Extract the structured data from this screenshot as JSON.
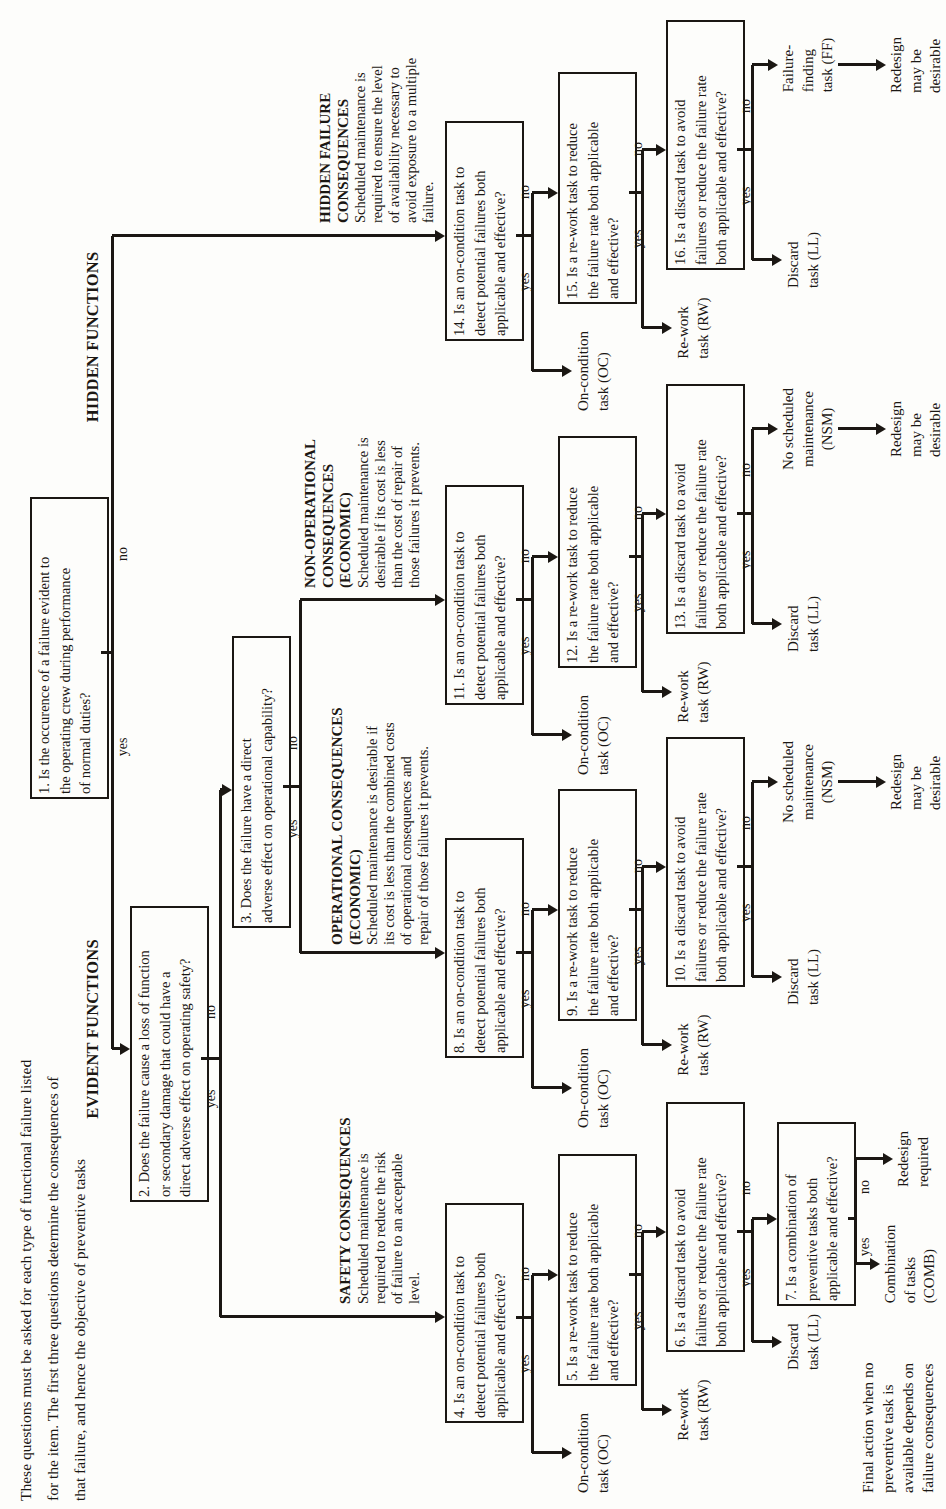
{
  "colors": {
    "ink": "#1b1713",
    "paper": "#fdfdfb"
  },
  "intro_note_lines": [
    "These questions must be asked for each type of functional failure listed",
    "for the item. The first three questions determine the consequences of",
    "that failure, and hence the objective of preventive tasks"
  ],
  "final_note_lines": [
    "Final action when no",
    "preventive task is",
    "available depends on",
    "failure consequences"
  ],
  "branch_labels": {
    "evident": "EVIDENT FUNCTIONS",
    "hidden": "HIDDEN FUNCTIONS"
  },
  "decision_labels": {
    "yes": "yes",
    "no": "no"
  },
  "question1_lines": [
    "1. Is the occurence of a failure evident to",
    "the operating crew during performance",
    "of normal duties?"
  ],
  "question2_lines": [
    "2. Does the failure cause a loss of function",
    "or secondary damage that could have a",
    "direct adverse effect on operating safety?"
  ],
  "question3_lines": [
    "3. Does the failure have a direct",
    "adverse effect on operational capability?"
  ],
  "chains": [
    {
      "key": "safety",
      "heading_lines": [
        "SAFETY CONSEQUENCES"
      ],
      "body_lines": [
        "Scheduled maintenance is",
        "required to reduce the risk",
        "of failure to an acceptable",
        "level."
      ],
      "questions": [
        [
          "4. Is an on-condition task to",
          "detect potential failures both",
          "applicable and effective?"
        ],
        [
          "5. Is a re-work task to reduce",
          "the failure rate both applicable",
          "and effective?"
        ],
        [
          "6. Is a discard task to avoid",
          "failures or reduce the failure rate",
          "both applicable and effective?"
        ]
      ],
      "on_condition_lines": [
        "On-condition",
        "task (OC)"
      ],
      "rework_lines": [
        "Re-work",
        "task (RW)"
      ],
      "discard_lines": [
        "Discard",
        "task (LL)"
      ],
      "question7_lines": [
        "7. Is a combination of",
        "preventive tasks both",
        "applicable and effective?"
      ],
      "combination_lines": [
        "Combination",
        "of tasks",
        "(COMB)"
      ],
      "redesign_lines": [
        "Redesign",
        "required"
      ]
    },
    {
      "key": "operational",
      "heading_lines": [
        "OPERATIONAL CONSEQUENCES",
        "(ECONOMIC)"
      ],
      "body_lines": [
        "Scheduled maintenance is desirable if",
        "its cost is less than the combined costs",
        "of operational consequences and",
        "repair of those failures it prevents."
      ],
      "questions": [
        [
          "8. Is an on-condition task to",
          "detect potential failures both",
          "applicable and effective?"
        ],
        [
          "9. Is a re-work task to reduce",
          "the failure rate both applicable",
          "and effective?"
        ],
        [
          "10. Is a discard task to avoid",
          "failures or reduce the failure rate",
          "both applicable and effective?"
        ]
      ],
      "on_condition_lines": [
        "On-condition",
        "task (OC)"
      ],
      "rework_lines": [
        "Re-work",
        "task (RW)"
      ],
      "discard_lines": [
        "Discard",
        "task (LL)"
      ],
      "terminal_lines": [
        "No scheduled",
        "maintenance",
        "(NSM)"
      ],
      "redesign_lines": [
        "Redesign",
        "may be",
        "desirable"
      ]
    },
    {
      "key": "non-operational",
      "heading_lines": [
        "NON-OPERATIONAL",
        "CONSEQUENCES",
        "(ECONOMIC)"
      ],
      "body_lines": [
        "Scheduled maintenance is",
        "desirable if its cost is less",
        "than the cost of repair of",
        "those failures it prevents."
      ],
      "questions": [
        [
          "11. Is an on-condition task to",
          "detect potential failures both",
          "applicable and effective?"
        ],
        [
          "12. Is a re-work task to reduce",
          "the failure rate both applicable",
          "and effective?"
        ],
        [
          "13. Is a discard task to avoid",
          "failures or reduce the failure rate",
          "both applicable and effective?"
        ]
      ],
      "on_condition_lines": [
        "On-condition",
        "task (OC)"
      ],
      "rework_lines": [
        "Re-work",
        "task (RW)"
      ],
      "discard_lines": [
        "Discard",
        "task (LL)"
      ],
      "terminal_lines": [
        "No scheduled",
        "maintenance",
        "(NSM)"
      ],
      "redesign_lines": [
        "Redesign",
        "may be",
        "desirable"
      ]
    },
    {
      "key": "hidden",
      "heading_lines": [
        "HIDDEN FAILURE",
        "CONSEQUENCES"
      ],
      "body_lines": [
        "Scheduled maintenance is",
        "required to ensure the level",
        "of availability necessary to",
        "avoid exposure to a multiple",
        "failure."
      ],
      "questions": [
        [
          "14. Is an on-condition task to",
          "detect potential failures both",
          "applicable and effective?"
        ],
        [
          "15. Is a re-work task to reduce",
          "the failure rate both applicable",
          "and effective?"
        ],
        [
          "16. Is a discard task to avoid",
          "failures or reduce the failure rate",
          "both applicable and effective?"
        ]
      ],
      "on_condition_lines": [
        "On-condition",
        "task (OC)"
      ],
      "rework_lines": [
        "Re-work",
        "task (RW)"
      ],
      "discard_lines": [
        "Discard",
        "task (LL)"
      ],
      "terminal_lines": [
        "Failure-",
        "finding",
        "task (FF)"
      ],
      "redesign_lines": [
        "Redesign",
        "may be",
        "desirable"
      ]
    }
  ]
}
